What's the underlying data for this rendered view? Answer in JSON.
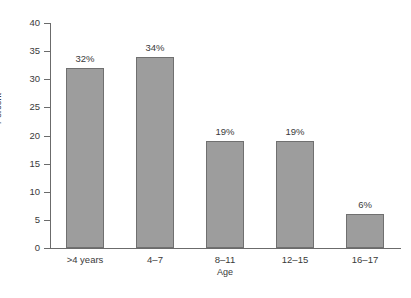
{
  "chart_data": {
    "type": "bar",
    "title": "",
    "subtitle": "",
    "xlabel": "Age",
    "ylabel": "Percent",
    "categories": [
      ">4 years",
      "4–7",
      "8–11",
      "12–15",
      "16–17"
    ],
    "values": [
      32,
      34,
      19,
      19,
      6
    ],
    "data_labels": [
      "32%",
      "34%",
      "19%",
      "19%",
      "6%"
    ],
    "ylim": [
      0,
      40
    ],
    "yticks": [
      0,
      5,
      10,
      15,
      20,
      25,
      30,
      35,
      40
    ],
    "ytick_labels": [
      "0",
      "5",
      "10",
      "15",
      "20",
      "25",
      "30",
      "35",
      "40"
    ],
    "grid": false,
    "legend": false,
    "legend_position": "none",
    "bar_fill_color": "#9d9d9d",
    "bar_border_color": "#707070",
    "axis_color": "#6b6b6b",
    "text_color": "#3a3a3a",
    "background_color": "#ffffff"
  }
}
